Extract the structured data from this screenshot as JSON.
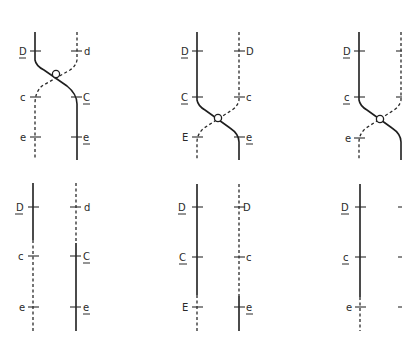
{
  "figure": {
    "colors": {
      "line": "#1e1e1e",
      "background": "#ffffff"
    },
    "top_row": [
      {
        "id": "top-1",
        "left_labels": [
          {
            "text": "D",
            "underline": true
          },
          {
            "text": "c",
            "underline": false
          },
          {
            "text": "e",
            "underline": false
          }
        ],
        "right_labels": [
          {
            "text": "d",
            "underline": false
          },
          {
            "text": "C",
            "underline": true
          },
          {
            "text": "e",
            "underline": true
          }
        ],
        "crossover": "between D and C"
      },
      {
        "id": "top-2",
        "left_labels": [
          {
            "text": "D",
            "underline": true
          },
          {
            "text": "C",
            "underline": true
          },
          {
            "text": "E",
            "underline": false
          }
        ],
        "right_labels": [
          {
            "text": "D",
            "underline": false
          },
          {
            "text": "c",
            "underline": false
          },
          {
            "text": "e",
            "underline": true
          }
        ],
        "crossover": "between C and E"
      },
      {
        "id": "top-3",
        "left_labels": [
          {
            "text": "D",
            "underline": true
          },
          {
            "text": "c",
            "underline": true
          },
          {
            "text": "e",
            "underline": false
          }
        ],
        "right_labels": [],
        "crossover": "between c and e"
      }
    ],
    "bottom_row": [
      {
        "id": "bottom-1",
        "left_labels": [
          {
            "text": "D",
            "underline": true
          },
          {
            "text": "c",
            "underline": false
          },
          {
            "text": "e",
            "underline": false
          }
        ],
        "right_labels": [
          {
            "text": "d",
            "underline": false
          },
          {
            "text": "C",
            "underline": true
          },
          {
            "text": "e",
            "underline": true
          }
        ]
      },
      {
        "id": "bottom-2",
        "left_labels": [
          {
            "text": "D",
            "underline": true
          },
          {
            "text": "C",
            "underline": true
          },
          {
            "text": "E",
            "underline": false
          }
        ],
        "right_labels": [
          {
            "text": "D",
            "underline": false
          },
          {
            "text": "c",
            "underline": false
          },
          {
            "text": "e",
            "underline": true
          }
        ]
      },
      {
        "id": "bottom-3",
        "left_labels": [
          {
            "text": "D",
            "underline": true
          },
          {
            "text": "c",
            "underline": true
          },
          {
            "text": "e",
            "underline": false
          }
        ],
        "right_labels": []
      }
    ]
  }
}
